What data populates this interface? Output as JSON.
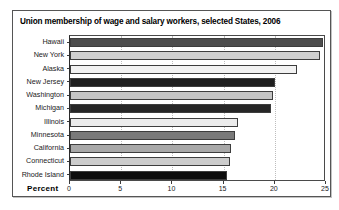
{
  "chart_data": {
    "type": "bar",
    "orientation": "horizontal",
    "title": "Union membership of wage and salary workers, selected States, 2006",
    "xlabel": "Percent",
    "ylabel": "",
    "xlim": [
      0,
      25
    ],
    "ylim": null,
    "grid": true,
    "legend": null,
    "xticks": [
      0,
      5,
      10,
      15,
      20,
      25
    ],
    "xtick_labels": [
      "0",
      "5",
      "10",
      "15",
      "20",
      "25"
    ],
    "categories": [
      "Hawaii",
      "New York",
      "Alaska",
      "New Jersey",
      "Washington",
      "Michigan",
      "Illinois",
      "Minnesota",
      "California",
      "Connecticut",
      "Rhode Island"
    ],
    "values": [
      24.7,
      24.4,
      22.2,
      20.0,
      19.8,
      19.6,
      16.4,
      16.1,
      15.7,
      15.6,
      15.3
    ],
    "bar_colors": [
      "#4d4d4d",
      "#cfcfcf",
      "#f2f2f2",
      "#1f1f1f",
      "#c4c4c4",
      "#262626",
      "#ebebeb",
      "#7a7a7a",
      "#a8a8a8",
      "#cccccc",
      "#0d0d0d"
    ]
  },
  "frame": {
    "border_color": "#555555",
    "plot_border_color": "#4a4a4a",
    "gridline_color": "#bdbdbd",
    "background": "#ffffff"
  }
}
